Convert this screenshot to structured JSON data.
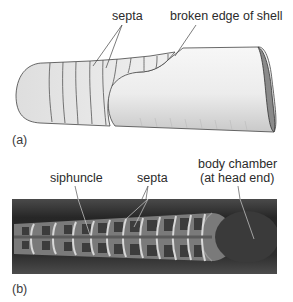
{
  "figure": {
    "panel_a": {
      "id_label": "(a)",
      "labels": {
        "septa": "septa",
        "broken_edge": "broken edge of shell"
      }
    },
    "panel_b": {
      "id_label": "(b)",
      "labels": {
        "siphuncle": "siphuncle",
        "septa": "septa",
        "body_chamber_line1": "body chamber",
        "body_chamber_line2": "(at head end)"
      }
    }
  }
}
